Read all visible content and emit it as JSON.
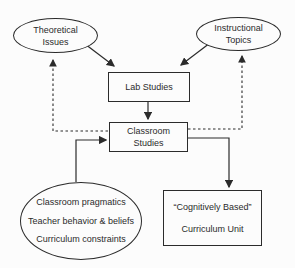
{
  "diagram": {
    "nodes": {
      "theoretical": {
        "line1": "Theoretical",
        "line2": "Issues"
      },
      "instructional": {
        "line1": "Instructional",
        "line2": "Topics"
      },
      "lab": {
        "label": "Lab Studies"
      },
      "classroom": {
        "line1": "Classroom",
        "line2": "Studies"
      },
      "factors": {
        "line1": "Classroom pragmatics",
        "line2": "Teacher behavior & beliefs",
        "line3": "Curriculum constraints"
      },
      "curriculum": {
        "line1": "“Cognitively Based”",
        "line2": "Curriculum Unit"
      }
    },
    "colors": {
      "line": "#2b2b2b",
      "text": "#2b2b2b",
      "background": "#fcfcfc"
    }
  }
}
